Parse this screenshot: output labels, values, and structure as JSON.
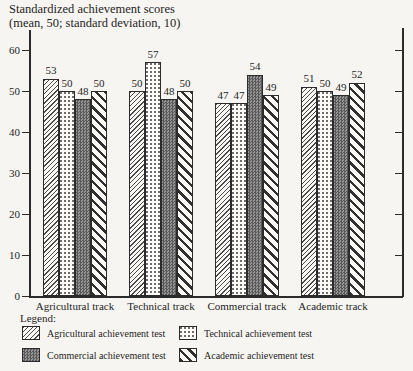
{
  "title": {
    "line1": "Standardized achievement scores",
    "line2": "(mean, 50; standard deviation, 10)"
  },
  "chart_data": {
    "type": "bar",
    "title": "Standardized achievement scores (mean, 50; standard deviation, 10)",
    "categories": [
      "Agricultural track",
      "Technical track",
      "Commercial track",
      "Academic track"
    ],
    "series": [
      {
        "name": "Agricultural achievement test",
        "pattern": "agri",
        "pattern_desc": "thin forward-diagonal hatch",
        "values": [
          53,
          50,
          47,
          51
        ]
      },
      {
        "name": "Technical achievement test",
        "pattern": "tech",
        "pattern_desc": "sparse dot stipple",
        "values": [
          50,
          57,
          47,
          50
        ]
      },
      {
        "name": "Commercial achievement test",
        "pattern": "comm",
        "pattern_desc": "dark gray checker dither",
        "values": [
          48,
          48,
          54,
          49
        ]
      },
      {
        "name": "Academic achievement test",
        "pattern": "acad",
        "pattern_desc": "thick backward-diagonal stripes",
        "values": [
          50,
          50,
          49,
          52
        ]
      }
    ],
    "xlabel": "",
    "ylabel": "Standardized achievement scores",
    "ylim": [
      0,
      60
    ],
    "yticks": [
      0,
      10,
      20,
      30,
      40,
      50,
      60
    ],
    "grid": false,
    "value_labels_shown": true,
    "legend_position": "bottom"
  },
  "legend": {
    "heading": "Legend:",
    "items": [
      {
        "label": "Agricultural achievement test",
        "pattern": "agri"
      },
      {
        "label": "Technical achievement test",
        "pattern": "tech"
      },
      {
        "label": "Commercial achievement test",
        "pattern": "comm"
      },
      {
        "label": "Academic achievement test",
        "pattern": "acad"
      }
    ]
  },
  "colors": {
    "ink": "#2b2b2b",
    "paper": "#f7f5f1",
    "dark_bar_gray": "#7a7a7a"
  }
}
